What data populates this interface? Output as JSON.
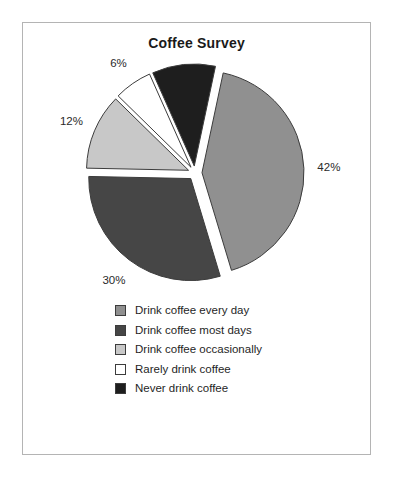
{
  "frame": {
    "border_color": "#b4b4b4",
    "background": "#ffffff"
  },
  "chart_data": {
    "type": "pie",
    "title": "Coffee Survey",
    "xlabel": "",
    "ylabel": "",
    "legend_position": "bottom",
    "exploded": true,
    "categories": [
      "Drink coffee every day",
      "Drink coffee most days",
      "Drink coffee occasionally",
      "Rarely drink coffee",
      "Never drink coffee"
    ],
    "values": [
      42,
      30,
      12,
      6,
      10
    ],
    "value_labels": [
      "42%",
      "30%",
      "12%",
      "6%",
      "10%"
    ],
    "colors": [
      "#909090",
      "#464646",
      "#c8c8c8",
      "#ffffff",
      "#1e1e1e"
    ],
    "units": "percent",
    "total": 100
  },
  "legend": {
    "items": [
      {
        "label": "Drink coffee every day",
        "color": "#909090"
      },
      {
        "label": "Drink coffee most days",
        "color": "#464646"
      },
      {
        "label": "Drink coffee occasionally",
        "color": "#c8c8c8"
      },
      {
        "label": "Rarely drink coffee",
        "color": "#ffffff"
      },
      {
        "label": "Never drink coffee",
        "color": "#1e1e1e"
      }
    ]
  }
}
